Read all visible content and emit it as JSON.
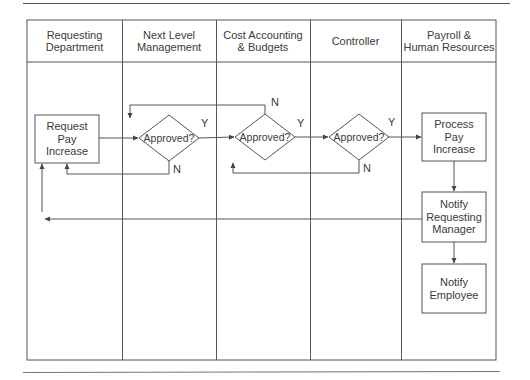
{
  "diagram": {
    "type": "swimlane-flowchart",
    "lanes": [
      {
        "label_line1": "Requesting",
        "label_line2": "Department"
      },
      {
        "label_line1": "Next Level",
        "label_line2": "Management"
      },
      {
        "label_line1": "Cost Accounting",
        "label_line2": "& Budgets"
      },
      {
        "label_line1": "Controller",
        "label_line2": ""
      },
      {
        "label_line1": "Payroll &",
        "label_line2": "Human Resources"
      }
    ],
    "nodes": {
      "request": {
        "line1": "Request",
        "line2": "Pay",
        "line3": "Increase"
      },
      "decision1": {
        "label": "Approved?"
      },
      "decision2": {
        "label": "Approved?"
      },
      "decision3": {
        "label": "Approved?"
      },
      "process": {
        "line1": "Process",
        "line2": "Pay",
        "line3": "Increase"
      },
      "notify_manager": {
        "line1": "Notify",
        "line2": "Requesting",
        "line3": "Manager"
      },
      "notify_employee": {
        "line1": "Notify",
        "line2": "Employee"
      }
    },
    "edge_labels": {
      "yes": "Y",
      "no": "N"
    },
    "colors": {
      "line": "#555555",
      "text": "#3a3a3a",
      "background": "#ffffff"
    }
  }
}
